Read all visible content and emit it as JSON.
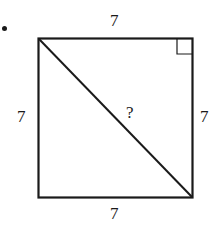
{
  "diagram": {
    "shape": "square",
    "labels": {
      "top": "7",
      "left": "7",
      "right": "7",
      "bottom": "7",
      "diagonal": "?"
    },
    "right_angle_marker": "top-right",
    "colors": {
      "stroke": "#1a1a1a",
      "background": "#ffffff"
    }
  }
}
